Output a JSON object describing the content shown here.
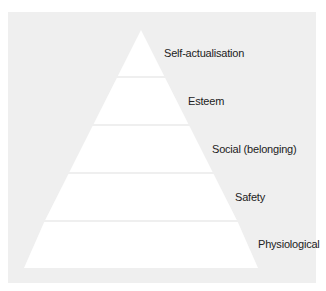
{
  "diagram": {
    "type": "pyramid",
    "colors": {
      "background": "#efefef",
      "pyramid_fill": "#ffffff",
      "text": "#222222"
    },
    "levels": [
      {
        "label": "Self-actualisation"
      },
      {
        "label": "Esteem"
      },
      {
        "label": "Social (belonging)"
      },
      {
        "label": "Safety"
      },
      {
        "label": "Physiological"
      }
    ]
  }
}
